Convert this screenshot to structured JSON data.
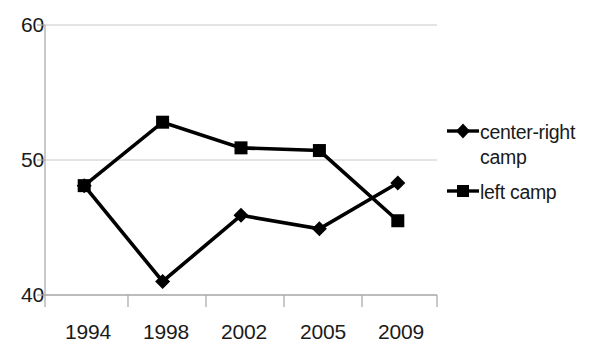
{
  "chart_data": {
    "type": "line",
    "title": "",
    "xlabel": "",
    "ylabel": "",
    "categories": [
      "1994",
      "1998",
      "2002",
      "2005",
      "2009"
    ],
    "ylim": [
      40,
      60
    ],
    "y_ticks": [
      "40",
      "50",
      "60"
    ],
    "grid": true,
    "legend_position": "right",
    "series": [
      {
        "name": "center-right camp",
        "marker": "diamond",
        "color": "#000000",
        "values": [
          48.1,
          41.0,
          45.9,
          44.9,
          48.3
        ]
      },
      {
        "name": "left camp",
        "marker": "square",
        "color": "#000000",
        "values": [
          48.1,
          52.8,
          50.9,
          50.7,
          45.5
        ]
      }
    ]
  },
  "axes": {
    "y_tick_labels": [
      "60",
      "50",
      "40"
    ],
    "x_tick_labels": [
      "1994",
      "1998",
      "2002",
      "2005",
      "2009"
    ]
  },
  "legend": {
    "entries": [
      {
        "label_line1": "center-right",
        "label_line2": "camp",
        "marker": "diamond-line-marker"
      },
      {
        "label_line1": "left camp",
        "label_line2": "",
        "marker": "square-line-marker"
      }
    ]
  },
  "colors": {
    "series_line": "#000000",
    "gridline": "#c8c8c8",
    "axis": "#a6a6a6",
    "text": "#1a1a1a",
    "background": "#ffffff"
  }
}
